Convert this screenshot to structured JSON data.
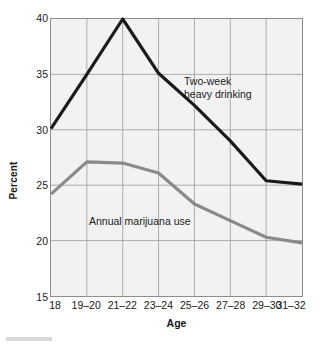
{
  "chart_data": {
    "type": "line",
    "title": "",
    "xlabel": "Age",
    "ylabel": "Percent",
    "categories": [
      "18",
      "19–20",
      "21–22",
      "23–24",
      "25–26",
      "27–28",
      "29–30",
      "31–32"
    ],
    "ylim": [
      15,
      40
    ],
    "yticks": [
      15,
      20,
      25,
      30,
      35,
      40
    ],
    "ytick_labels": [
      "15",
      "20",
      "25",
      "30",
      "35",
      "40"
    ],
    "grid": true,
    "legend_position": "inline-annotations",
    "series": [
      {
        "name": "Two-week heavy drinking",
        "color": "#1a1a1a",
        "values": [
          30.1,
          35.0,
          40.0,
          35.1,
          32.2,
          29.0,
          25.4,
          25.1
        ]
      },
      {
        "name": "Annual marijuana use",
        "color": "#8a8a8a",
        "values": [
          24.2,
          27.1,
          27.0,
          26.1,
          23.3,
          21.8,
          20.3,
          19.8
        ]
      }
    ],
    "annotations": [
      {
        "text": "Two-week\nheavy drinking",
        "series": "Two-week heavy drinking"
      },
      {
        "text": "Annual marijuana use",
        "series": "Annual marijuana use"
      }
    ]
  },
  "axes": {
    "y_title": "Percent",
    "x_title": "Age"
  },
  "colors": {
    "plot_background": "#f2f2f2",
    "grid": "#9a9a9a",
    "frame": "#8d8d8d",
    "series_dark": "#1a1a1a",
    "series_gray": "#8a8a8a",
    "page_background": "#ffffff"
  }
}
